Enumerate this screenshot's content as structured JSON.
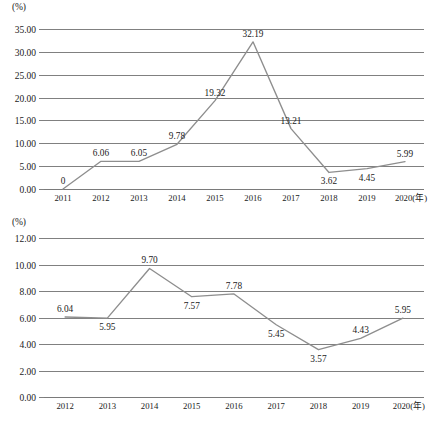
{
  "chart_data": [
    {
      "id": "top",
      "type": "line",
      "title": "",
      "xlabel": "年",
      "ylabel": "(%)",
      "unit_label": "(%)",
      "x_axis_suffix": "(年)",
      "categories": [
        "2011",
        "2012",
        "2013",
        "2014",
        "2015",
        "2016",
        "2017",
        "2018",
        "2019",
        "2020"
      ],
      "values": [
        0,
        6.06,
        6.05,
        9.78,
        19.32,
        32.19,
        13.21,
        3.62,
        4.45,
        5.99
      ],
      "data_labels": [
        "0",
        "6.06",
        "6.05",
        "9.78",
        "19.32",
        "32.19",
        "13.21",
        "3.62",
        "4.45",
        "5.99"
      ],
      "ylim": [
        0,
        35
      ],
      "ytick_step": 5,
      "ytick_labels": [
        "0.00",
        "5.00",
        "10.00",
        "15.00",
        "20.00",
        "25.00",
        "30.00",
        "35.00"
      ],
      "grid": true,
      "legend": "none",
      "series_color": "#8e8e8e"
    },
    {
      "id": "bottom",
      "type": "line",
      "title": "",
      "xlabel": "年",
      "ylabel": "(%)",
      "unit_label": "(%)",
      "x_axis_suffix": "(年)",
      "categories": [
        "2012",
        "2013",
        "2014",
        "2015",
        "2016",
        "2017",
        "2018",
        "2019",
        "2020"
      ],
      "values": [
        6.04,
        5.95,
        9.7,
        7.57,
        7.78,
        5.45,
        3.57,
        4.43,
        5.95
      ],
      "data_labels": [
        "6.04",
        "5.95",
        "9.70",
        "7.57",
        "7.78",
        "5.45",
        "3.57",
        "4.43",
        "5.95"
      ],
      "ylim": [
        0,
        12
      ],
      "ytick_step": 2,
      "ytick_labels": [
        "0.00",
        "2.00",
        "4.00",
        "6.00",
        "8.00",
        "10.00",
        "12.00"
      ],
      "grid": true,
      "legend": "none",
      "series_color": "#8e8e8e"
    }
  ],
  "charts": {
    "top": {
      "unit": "(%)",
      "label_positions": [
        "above",
        "above",
        "above",
        "above",
        "above",
        "above",
        "above",
        "below",
        "below",
        "above"
      ]
    },
    "bottom": {
      "unit": "(%)",
      "label_positions": [
        "above",
        "below",
        "above",
        "below",
        "above",
        "below",
        "below",
        "above",
        "above"
      ]
    }
  }
}
